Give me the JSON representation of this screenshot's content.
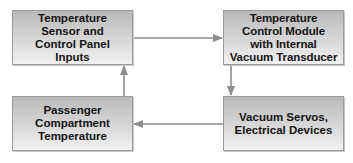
{
  "diagram": {
    "type": "flowchart-loop",
    "colors": {
      "box_top": "#b9b9b9",
      "box_bottom": "#f1f1f1",
      "border": "#9a9a9a",
      "arrow": "#8c8c8c",
      "text": "#141414"
    },
    "nodes": [
      {
        "id": "sensor",
        "label": "Temperature\nSensor and\nControl Panel\nInputs"
      },
      {
        "id": "module",
        "label": "Temperature\nControl Module\nwith Internal\nVacuum Transducer"
      },
      {
        "id": "compartment",
        "label": "Passenger\nCompartment\nTemperature"
      },
      {
        "id": "servos",
        "label": "Vacuum Servos,\nElectrical Devices"
      }
    ],
    "edges": [
      {
        "from": "sensor",
        "to": "module",
        "direction": "right"
      },
      {
        "from": "module",
        "to": "servos",
        "direction": "down"
      },
      {
        "from": "servos",
        "to": "compartment",
        "direction": "left"
      },
      {
        "from": "compartment",
        "to": "sensor",
        "direction": "up"
      }
    ]
  }
}
